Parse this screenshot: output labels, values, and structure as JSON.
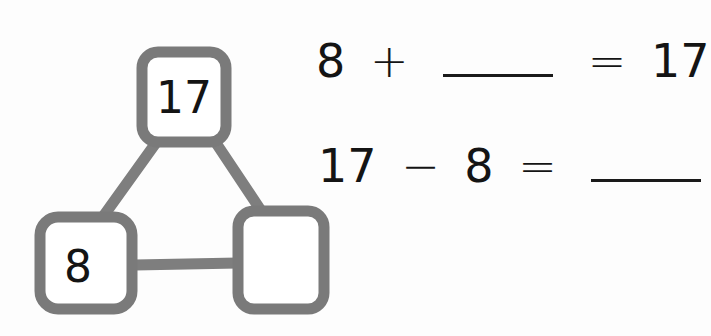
{
  "number_bond": {
    "whole": "17",
    "part_known": "8",
    "part_unknown": "",
    "clay_color": "#7a7a7a",
    "clay_highlight": "#9a9a9a"
  },
  "equations": [
    {
      "tokens": [
        "8",
        "+",
        "",
        "=",
        "17"
      ],
      "blank_index": 2
    },
    {
      "tokens": [
        "17",
        "−",
        "8",
        "=",
        ""
      ],
      "blank_index": 4
    }
  ]
}
